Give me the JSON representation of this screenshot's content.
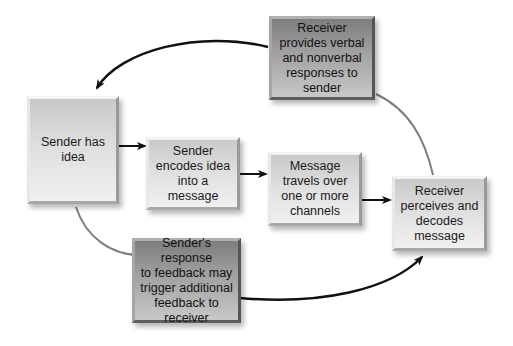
{
  "diagram": {
    "nodes": {
      "sender_idea": {
        "label": "Sender has\nidea",
        "style": "light"
      },
      "encode": {
        "label": "Sender\nencodes idea\ninto a\nmessage",
        "style": "light"
      },
      "channel": {
        "label": "Message\ntravels over\none or more\nchannels",
        "style": "light"
      },
      "receiver_decode": {
        "label": "Receiver\nperceives and\ndecodes\nmessage",
        "style": "light"
      },
      "receiver_feedback": {
        "label": "Receiver\nprovides verbal\nand nonverbal\nresponses to\nsender",
        "style": "dark"
      },
      "sender_response": {
        "label": "Sender's response\nto feedback may\ntrigger additional\nfeedback to\nreceiver",
        "style": "dark"
      }
    },
    "edges": [
      {
        "from": "sender_idea",
        "to": "encode",
        "type": "arrow"
      },
      {
        "from": "encode",
        "to": "channel",
        "type": "arrow"
      },
      {
        "from": "channel",
        "to": "receiver_decode",
        "type": "arrow"
      },
      {
        "from": "receiver_decode",
        "to": "receiver_feedback",
        "type": "line"
      },
      {
        "from": "receiver_feedback",
        "to": "sender_idea",
        "type": "curved-arrow"
      },
      {
        "from": "sender_idea",
        "to": "sender_response",
        "type": "line"
      },
      {
        "from": "sender_response",
        "to": "receiver_decode",
        "type": "curved-arrow"
      }
    ],
    "colors": {
      "arrow": "#111111",
      "connector_line": "#7a7a7a",
      "light_box": "#dedede",
      "dark_box": "#a2a2a2"
    }
  }
}
